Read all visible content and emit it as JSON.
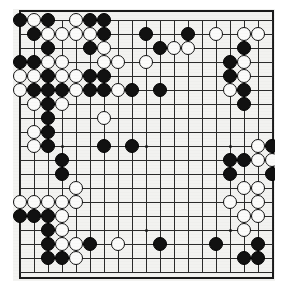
{
  "board": {
    "game": "go",
    "size": 19,
    "label": "go-board",
    "colors": {
      "black_stone": "#111111",
      "white_stone": "#fbfbfa",
      "grid_line": "#2a2a2a",
      "board_background": "#f2f2f0",
      "page_background": "#ffffff",
      "border": "#1a1a1a"
    },
    "geometry": {
      "origin_x": 20,
      "origin_y": 20,
      "spacing": 14,
      "stone_diameter": 14,
      "border_left": 19,
      "border_top": 10,
      "border_width": 255,
      "border_height": 269
    },
    "star_points": [
      [
        4,
        4
      ],
      [
        10,
        4
      ],
      [
        16,
        4
      ],
      [
        4,
        10
      ],
      [
        10,
        10
      ],
      [
        16,
        10
      ],
      [
        4,
        16
      ],
      [
        10,
        16
      ],
      [
        16,
        16
      ]
    ],
    "black_stones": [
      [
        1,
        1
      ],
      [
        3,
        1
      ],
      [
        6,
        1
      ],
      [
        7,
        1
      ],
      [
        2,
        2
      ],
      [
        7,
        2
      ],
      [
        10,
        2
      ],
      [
        13,
        2
      ],
      [
        3,
        3
      ],
      [
        6,
        3
      ],
      [
        11,
        3
      ],
      [
        17,
        3
      ],
      [
        1,
        4
      ],
      [
        2,
        4
      ],
      [
        16,
        4
      ],
      [
        3,
        5
      ],
      [
        6,
        5
      ],
      [
        7,
        5
      ],
      [
        16,
        5
      ],
      [
        2,
        6
      ],
      [
        3,
        6
      ],
      [
        4,
        6
      ],
      [
        6,
        6
      ],
      [
        7,
        6
      ],
      [
        9,
        6
      ],
      [
        11,
        6
      ],
      [
        17,
        6
      ],
      [
        3,
        7
      ],
      [
        17,
        7
      ],
      [
        3,
        8
      ],
      [
        3,
        9
      ],
      [
        3,
        10
      ],
      [
        7,
        10
      ],
      [
        9,
        10
      ],
      [
        19,
        10
      ],
      [
        16,
        11
      ],
      [
        17,
        11
      ],
      [
        4,
        11
      ],
      [
        4,
        12
      ],
      [
        16,
        12
      ],
      [
        19,
        12
      ],
      [
        1,
        15
      ],
      [
        2,
        15
      ],
      [
        3,
        15
      ],
      [
        3,
        16
      ],
      [
        3,
        17
      ],
      [
        6,
        17
      ],
      [
        11,
        17
      ],
      [
        15,
        17
      ],
      [
        18,
        17
      ],
      [
        3,
        18
      ],
      [
        4,
        18
      ],
      [
        17,
        18
      ],
      [
        18,
        18
      ]
    ],
    "white_stones": [
      [
        2,
        1
      ],
      [
        5,
        1
      ],
      [
        3,
        2
      ],
      [
        4,
        2
      ],
      [
        5,
        2
      ],
      [
        6,
        2
      ],
      [
        15,
        2
      ],
      [
        17,
        2
      ],
      [
        18,
        2
      ],
      [
        7,
        3
      ],
      [
        12,
        3
      ],
      [
        13,
        3
      ],
      [
        3,
        4
      ],
      [
        4,
        4
      ],
      [
        7,
        4
      ],
      [
        8,
        4
      ],
      [
        10,
        4
      ],
      [
        17,
        4
      ],
      [
        1,
        5
      ],
      [
        2,
        5
      ],
      [
        4,
        5
      ],
      [
        5,
        5
      ],
      [
        17,
        5
      ],
      [
        1,
        6
      ],
      [
        5,
        6
      ],
      [
        8,
        6
      ],
      [
        16,
        6
      ],
      [
        2,
        7
      ],
      [
        4,
        7
      ],
      [
        7,
        8
      ],
      [
        2,
        9
      ],
      [
        2,
        10
      ],
      [
        18,
        10
      ],
      [
        18,
        11
      ],
      [
        19,
        11
      ],
      [
        5,
        13
      ],
      [
        17,
        13
      ],
      [
        18,
        13
      ],
      [
        1,
        14
      ],
      [
        2,
        14
      ],
      [
        3,
        14
      ],
      [
        4,
        14
      ],
      [
        5,
        14
      ],
      [
        16,
        14
      ],
      [
        18,
        14
      ],
      [
        4,
        15
      ],
      [
        17,
        15
      ],
      [
        18,
        15
      ],
      [
        4,
        16
      ],
      [
        17,
        16
      ],
      [
        4,
        17
      ],
      [
        5,
        17
      ],
      [
        8,
        17
      ],
      [
        5,
        18
      ]
    ]
  }
}
